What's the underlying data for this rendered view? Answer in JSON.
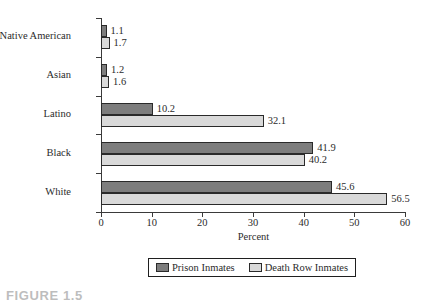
{
  "chart_data": {
    "type": "bar",
    "orientation": "horizontal",
    "title": "",
    "xlabel": "Percent",
    "ylabel": "",
    "xlim": [
      0,
      60
    ],
    "xticks": [
      0,
      10,
      20,
      30,
      40,
      50,
      60
    ],
    "grid": false,
    "legend_position": "bottom",
    "categories": [
      "Native American",
      "Asian",
      "Latino",
      "Black",
      "White"
    ],
    "series": [
      {
        "name": "Prison Inmates",
        "color": "#7d7d7d",
        "values": [
          1.1,
          1.2,
          10.2,
          41.9,
          45.6
        ]
      },
      {
        "name": "Death Row Inmates",
        "color": "#d9d9d9",
        "values": [
          1.7,
          1.6,
          32.1,
          40.2,
          56.5
        ]
      }
    ]
  },
  "caption": {
    "text": "FIGURE 1.5"
  }
}
